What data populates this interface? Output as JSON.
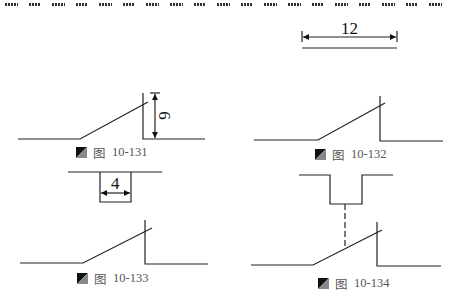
{
  "header": {
    "border_style": "dashed-blocks",
    "block_count": 19
  },
  "figures": [
    {
      "id": "fig-10-131",
      "caption_prefix": "图",
      "caption_number": "10-131",
      "dimension_label": "6",
      "dimension_orientation": "vertical"
    },
    {
      "id": "fig-10-132",
      "caption_prefix": "图",
      "caption_number": "10-132",
      "dimension_label": "12",
      "dimension_orientation": "horizontal"
    },
    {
      "id": "fig-10-133",
      "caption_prefix": "图",
      "caption_number": "10-133",
      "dimension_label": "4",
      "dimension_orientation": "horizontal"
    },
    {
      "id": "fig-10-134",
      "caption_prefix": "图",
      "caption_number": "10-134",
      "dimension_label": "",
      "dimension_orientation": "none"
    }
  ],
  "colors": {
    "line": "#222222",
    "caption_text": "#555555",
    "icon_dark": "#111111",
    "icon_light": "#888888"
  }
}
